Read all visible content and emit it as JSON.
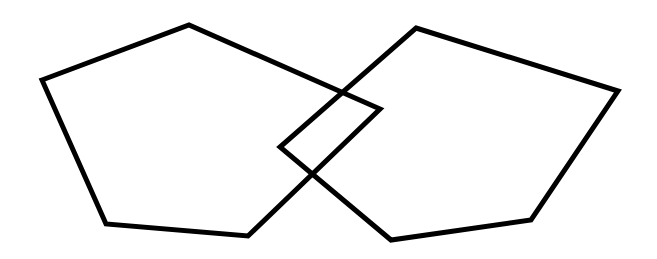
{
  "diagram": {
    "background": "#ffffff",
    "stroke_color": "#000000",
    "stroke_width": 5,
    "shapes": [
      {
        "name": "left-pentagon",
        "points": [
          [
            42,
            80
          ],
          [
            189,
            25
          ],
          [
            380,
            109
          ],
          [
            248,
            236
          ],
          [
            106,
            224
          ]
        ]
      },
      {
        "name": "right-pentagon",
        "points": [
          [
            416,
            28
          ],
          [
            618,
            91
          ],
          [
            531,
            220
          ],
          [
            391,
            240
          ],
          [
            280,
            147
          ]
        ]
      }
    ]
  }
}
